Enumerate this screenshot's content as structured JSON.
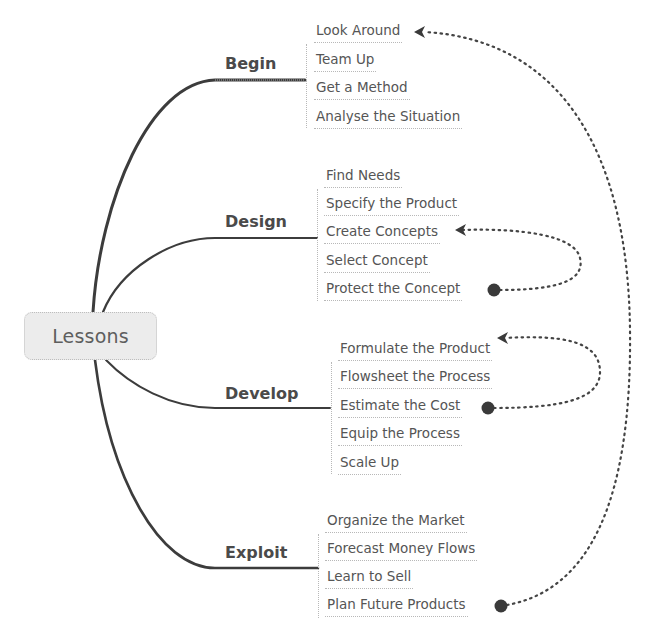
{
  "mindmap": {
    "root": {
      "label": "Lessons"
    },
    "branches": [
      {
        "label": "Begin",
        "items": [
          "Look Around",
          "Team Up",
          "Get a Method",
          "Analyse the Situation"
        ]
      },
      {
        "label": "Design",
        "items": [
          "Find Needs",
          "Specify the Product",
          "Create Concepts",
          "Select Concept",
          "Protect the Concept"
        ]
      },
      {
        "label": "Develop",
        "items": [
          "Formulate the Product",
          "Flowsheet the Process",
          "Estimate the Cost",
          "Equip the Process",
          "Scale Up"
        ]
      },
      {
        "label": "Exploit",
        "items": [
          "Organize the Market",
          "Forecast Money Flows",
          "Learn to Sell",
          "Plan Future Products"
        ]
      }
    ],
    "relationships": [
      {
        "from": "Protect the Concept",
        "to": "Create Concepts",
        "style": "dotted-arrow"
      },
      {
        "from": "Estimate the Cost",
        "to": "Formulate the Product",
        "style": "dotted-arrow"
      },
      {
        "from": "Plan Future Products",
        "to": "Look Around",
        "style": "dotted-arrow"
      }
    ],
    "colors": {
      "root_fill": "#ececec",
      "text": "#4a4a4a",
      "connector": "#3c3c3c",
      "dotted_line": "#444444"
    }
  }
}
